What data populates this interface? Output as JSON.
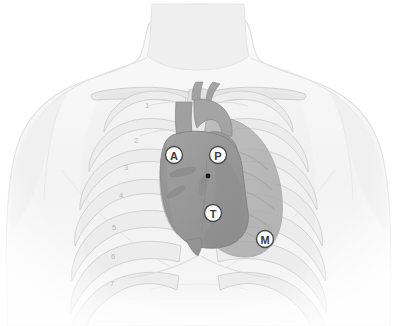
{
  "figure": {
    "type": "anatomical-illustration",
    "background_color": "#ffffff",
    "style": "grayscale medical illustration"
  },
  "colors": {
    "background": "#ffffff",
    "skin_fill": "#f4f4f4",
    "skin_outline": "#e3e3e3",
    "neck_fill": "#eeeeee",
    "bone_fill": "#e8e8e8",
    "bone_outline": "#cfcfcf",
    "rib_fill": "#ededed",
    "rib_outline": "#d2d2d2",
    "lung_fill": "#b2b2b2",
    "heart_fill": "#9a9a9a",
    "heart_outline": "#8a8a8a",
    "heart_dark": "#8c8c8c",
    "vessel_fill": "#a4a4a4",
    "marker_fill": "#ffffff",
    "marker_ring": "#4a4a4a",
    "marker_text": "#3a3a3a",
    "rib_number_text": "#b9b9b9",
    "dot_marker": "#1a1a1a"
  },
  "anatomy": {
    "structures": [
      {
        "name": "head-and-neck",
        "label": "Neck"
      },
      {
        "name": "torso",
        "label": "Torso"
      },
      {
        "name": "left-shoulder",
        "label": "Shoulder (right of figure)"
      },
      {
        "name": "right-shoulder",
        "label": "Shoulder (left of figure)"
      },
      {
        "name": "clavicles",
        "label": "Clavicles"
      },
      {
        "name": "sternum",
        "label": "Sternum"
      },
      {
        "name": "rib-cage",
        "label": "Rib cage"
      },
      {
        "name": "heart",
        "label": "Heart"
      },
      {
        "name": "great-vessels",
        "label": "Great vessels"
      },
      {
        "name": "left-lung",
        "label": "Left lung"
      },
      {
        "name": "xiphoid-process",
        "label": "Xiphoid process"
      }
    ]
  },
  "rib_numbers": [
    {
      "id": "rib-1",
      "label": "1",
      "x": 147,
      "y": 105
    },
    {
      "id": "rib-2",
      "label": "2",
      "x": 136,
      "y": 140
    },
    {
      "id": "rib-3",
      "label": "3",
      "x": 126,
      "y": 167
    },
    {
      "id": "rib-4",
      "label": "4",
      "x": 121,
      "y": 195
    },
    {
      "id": "rib-5",
      "label": "5",
      "x": 114,
      "y": 227
    },
    {
      "id": "rib-6",
      "label": "6",
      "x": 113,
      "y": 256
    },
    {
      "id": "rib-7",
      "label": "7",
      "x": 112,
      "y": 283
    }
  ],
  "auscultation_points": [
    {
      "id": "aortic",
      "letter": "A",
      "full_name": "Aortic area",
      "description": "Second right intercostal space at the right sternal border",
      "cx": 174,
      "cy": 155,
      "r": 8.5
    },
    {
      "id": "pulmonic",
      "letter": "P",
      "full_name": "Pulmonic area",
      "description": "Second left intercostal space at the left sternal border",
      "cx": 218,
      "cy": 155,
      "r": 8.5
    },
    {
      "id": "tricuspid",
      "letter": "T",
      "full_name": "Tricuspid area",
      "description": "Fourth left intercostal space at the lower left sternal border",
      "cx": 213,
      "cy": 213,
      "r": 8.5
    },
    {
      "id": "mitral",
      "letter": "M",
      "full_name": "Mitral area",
      "description": "Fifth left intercostal space at the midclavicular line (apex)",
      "cx": 265,
      "cy": 239,
      "r": 8.5
    }
  ],
  "reference_dot": {
    "id": "center-dot",
    "cx": 208,
    "cy": 176,
    "r": 2.4
  }
}
